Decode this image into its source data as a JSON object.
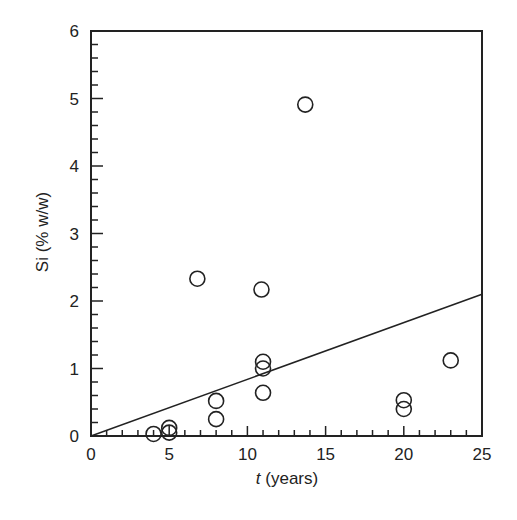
{
  "chart_data": {
    "type": "scatter",
    "title": "",
    "xlabel_italic": "t",
    "xlabel_rest": " (years)",
    "xlabel": "t (years)",
    "ylabel": "Si (% w/w)",
    "xlim": [
      0,
      25
    ],
    "ylim": [
      0,
      6
    ],
    "x_ticks": [
      0,
      5,
      10,
      15,
      20,
      25
    ],
    "x_tick_labels": [
      "0",
      "5",
      "10",
      "15",
      "20",
      "25"
    ],
    "y_ticks": [
      0,
      1,
      2,
      3,
      4,
      5,
      6
    ],
    "y_tick_labels": [
      "0",
      "1",
      "2",
      "3",
      "4",
      "5",
      "6"
    ],
    "x_minor_step": 1,
    "y_minor_step": 0.2,
    "grid": false,
    "legend": null,
    "series": [
      {
        "name": "measurements",
        "marker": "open-circle",
        "points": [
          {
            "x": 4,
            "y": 0.03
          },
          {
            "x": 5,
            "y": 0.05
          },
          {
            "x": 5,
            "y": 0.12
          },
          {
            "x": 6.8,
            "y": 2.33
          },
          {
            "x": 8,
            "y": 0.25
          },
          {
            "x": 8,
            "y": 0.52
          },
          {
            "x": 10.9,
            "y": 2.17
          },
          {
            "x": 11,
            "y": 1.1
          },
          {
            "x": 11,
            "y": 1.0
          },
          {
            "x": 11,
            "y": 0.64
          },
          {
            "x": 13.7,
            "y": 4.91
          },
          {
            "x": 20,
            "y": 0.53
          },
          {
            "x": 20,
            "y": 0.4
          },
          {
            "x": 23,
            "y": 1.12
          }
        ]
      },
      {
        "name": "fit-line",
        "type": "line",
        "points": [
          {
            "x": 0,
            "y": 0
          },
          {
            "x": 25,
            "y": 2.1
          }
        ]
      }
    ]
  },
  "style": {
    "axis_color": "#222222",
    "marker_stroke": "#222222",
    "line_color": "#222222"
  }
}
